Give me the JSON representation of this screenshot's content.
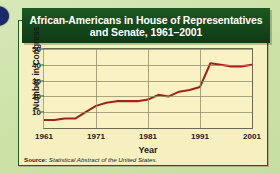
{
  "figure": {
    "title": "African-Americans in House of Representatives and Senate, 1961–2001",
    "source_prefix": "Source:",
    "source_text": "Statistical Abstract of the United States.",
    "colors": {
      "banner": "#14471a",
      "card_bg": "#f6efbf",
      "page_bg": "#cfe3ae",
      "line": "#9e2418",
      "border": "#1f5c27",
      "deco_circle": "#1b2a6b"
    }
  },
  "chart_data": {
    "type": "line",
    "title": "African-Americans in House of Representatives and Senate, 1961–2001",
    "xlabel": "Year",
    "ylabel": "Number in Congress",
    "xlim": [
      1961,
      2001
    ],
    "ylim": [
      0,
      50
    ],
    "xticks": [
      1961,
      1971,
      1981,
      1991,
      2001
    ],
    "yticks": [
      10,
      20,
      30,
      40,
      50
    ],
    "grid": true,
    "legend": false,
    "series": [
      {
        "name": "African-Americans in Congress",
        "color": "#9e2418",
        "x": [
          1961,
          1963,
          1965,
          1967,
          1969,
          1971,
          1973,
          1975,
          1977,
          1979,
          1981,
          1983,
          1985,
          1987,
          1989,
          1991,
          1993,
          1995,
          1997,
          1999,
          2001
        ],
        "values": [
          5,
          5,
          6,
          6,
          10,
          14,
          16,
          17,
          17,
          17,
          18,
          21,
          20,
          23,
          24,
          26,
          41,
          40,
          39,
          39,
          40
        ]
      }
    ]
  }
}
